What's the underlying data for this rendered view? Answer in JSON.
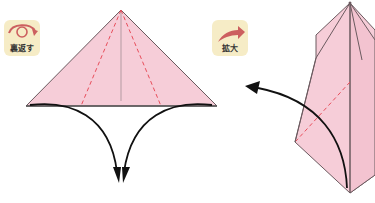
{
  "badges": {
    "flip": {
      "label": "裏返す",
      "icon": "flip-over-arrow-icon"
    },
    "enlarge": {
      "label": "拡大",
      "icon": "enlarge-curved-arrow-icon"
    }
  },
  "colors": {
    "paper": "#f6cdd8",
    "paper_dark": "#f0bccb",
    "edge": "#6b5a5f",
    "valley_fold": "#e84d5b",
    "arrow": "#111111",
    "badge_bg": "#f6ecc6",
    "badge_icon": "#cc5f5f"
  }
}
